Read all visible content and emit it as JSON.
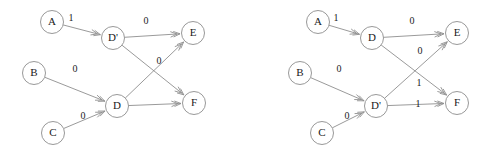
{
  "figure": {
    "title": "",
    "background_color": "#ffffff",
    "node_stroke_color": "#8c8c8c",
    "edge_stroke_color": "#8f8f8f",
    "text_color": "#1a1a1a",
    "node_radius": 11.5
  },
  "diagrams": [
    {
      "id": "left-graph",
      "name": "left-state-graph",
      "nodes": [
        {
          "id": "A",
          "label": "A",
          "x": 52,
          "y": 22
        },
        {
          "id": "Dp",
          "label": "D'",
          "x": 113,
          "y": 38
        },
        {
          "id": "E",
          "label": "E",
          "x": 193,
          "y": 33
        },
        {
          "id": "B",
          "label": "B",
          "x": 34,
          "y": 73
        },
        {
          "id": "D",
          "label": "D",
          "x": 117,
          "y": 106
        },
        {
          "id": "F",
          "label": "F",
          "x": 194,
          "y": 103
        },
        {
          "id": "C",
          "label": "C",
          "x": 53,
          "y": 133
        }
      ],
      "edges": [
        {
          "from": "A",
          "to": "Dp",
          "label": "1",
          "lx": 71,
          "ly": 19
        },
        {
          "from": "Dp",
          "to": "E",
          "label": "0",
          "lx": 146,
          "ly": 22
        },
        {
          "from": "B",
          "to": "D",
          "label": "0",
          "lx": 75,
          "ly": 70
        },
        {
          "from": "C",
          "to": "D",
          "label": "0",
          "lx": 83,
          "ly": 117
        },
        {
          "from": "Dp",
          "to": "F",
          "label": "",
          "lx": 0,
          "ly": 0
        },
        {
          "from": "D",
          "to": "E",
          "label": "0",
          "lx": 159,
          "ly": 62
        },
        {
          "from": "D",
          "to": "F",
          "label": "",
          "lx": 0,
          "ly": 0
        }
      ]
    },
    {
      "id": "right-graph",
      "name": "right-state-graph",
      "nodes": [
        {
          "id": "A",
          "label": "A",
          "x": 318,
          "y": 22
        },
        {
          "id": "D",
          "label": "D",
          "x": 372,
          "y": 38
        },
        {
          "id": "E",
          "label": "E",
          "x": 457,
          "y": 33
        },
        {
          "id": "B",
          "label": "B",
          "x": 300,
          "y": 73
        },
        {
          "id": "Dp",
          "label": "D'",
          "x": 376,
          "y": 106
        },
        {
          "id": "F",
          "label": "F",
          "x": 457,
          "y": 103
        },
        {
          "id": "C",
          "label": "C",
          "x": 322,
          "y": 133
        }
      ],
      "edges": [
        {
          "from": "A",
          "to": "D",
          "label": "1",
          "lx": 336,
          "ly": 19
        },
        {
          "from": "D",
          "to": "E",
          "label": "0",
          "lx": 412,
          "ly": 22
        },
        {
          "from": "B",
          "to": "Dp",
          "label": "0",
          "lx": 339,
          "ly": 70
        },
        {
          "from": "C",
          "to": "Dp",
          "label": "0",
          "lx": 347,
          "ly": 117
        },
        {
          "from": "Dp",
          "to": "E",
          "label": "0",
          "lx": 420,
          "ly": 52
        },
        {
          "from": "D",
          "to": "F",
          "label": "1",
          "lx": 419,
          "ly": 84
        },
        {
          "from": "Dp",
          "to": "F",
          "label": "1",
          "lx": 418,
          "ly": 105
        }
      ]
    }
  ]
}
